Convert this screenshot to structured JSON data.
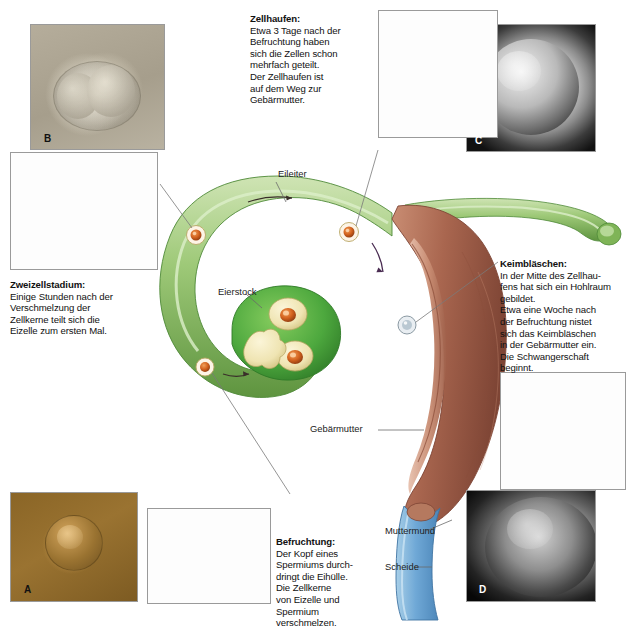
{
  "diagram": {
    "language": "de"
  },
  "callouts": [
    {
      "id": "zellhaufen",
      "title": "Zellhaufen:",
      "body": "Etwa 3 Tage nach der\nBefruchtung haben\nsich die Zellen schon\nmehrfach geteilt.\nDer Zellhaufen ist\nauf dem Weg zur\nGebärmutter."
    },
    {
      "id": "zweizellstadium",
      "title": "Zweizellstadium:",
      "body": "Einige Stunden nach der\nVerschmelzung der\nZellkerne teilt sich die\nEizelle zum ersten Mal."
    },
    {
      "id": "keimblaeschen",
      "title": "Keimbläschen:",
      "body": "In der Mitte des Zellhau-\nfens hat sich ein Hohlraum\ngebildet.\nEtwa eine Woche nach\nder Befruchtung nistet\nsich das Keimbläschen\nin der Gebärmutter ein.\nDie Schwangerschaft\nbeginnt."
    },
    {
      "id": "befruchtung",
      "title": "Befruchtung:",
      "body": "Der Kopf eines\nSpermiums durch-\ndringt die Eihülle.\nDie Zellkerne\nvon Eizelle und\nSpermium\nverschmelzen."
    }
  ],
  "anatomy_labels": [
    {
      "id": "eileiter",
      "text": "Eileiter"
    },
    {
      "id": "eierstock",
      "text": "Eierstock"
    },
    {
      "id": "gebaermutter",
      "text": "Gebärmutter"
    },
    {
      "id": "muttermund",
      "text": "Muttermund"
    },
    {
      "id": "scheide",
      "text": "Scheide"
    }
  ],
  "photo_letters": [
    {
      "id": "a",
      "text": "A"
    },
    {
      "id": "b",
      "text": "B"
    },
    {
      "id": "c",
      "text": "C"
    },
    {
      "id": "d",
      "text": "D"
    }
  ],
  "colors": {
    "tube_green_light": "#b8d79a",
    "tube_green_mid": "#8cbf63",
    "tube_green_dark": "#4f8a39",
    "ovary_green": "#4da83e",
    "uterus_brown": "#a9664f",
    "uterus_brown_dark": "#8a4b38",
    "vagina_blue": "#6fa8d6",
    "egg_orange": "#d4631f",
    "egg_nucleus": "#7a3310",
    "follicle_cream": "#efe4b2",
    "leader_line": "#5a5a5a",
    "frame_border": "#9a9a9a",
    "text": "#111111"
  }
}
